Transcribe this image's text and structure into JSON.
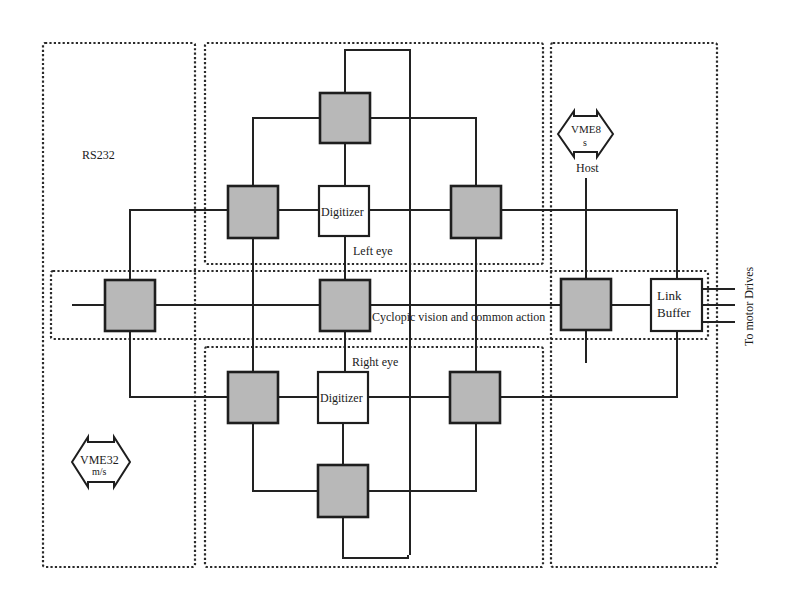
{
  "diagram": {
    "type": "hardware-architecture",
    "colors": {
      "node_fill": "#b8b8b8",
      "line": "#222222",
      "background": "#ffffff"
    },
    "regions": {
      "left_panel": {
        "label": "RS232"
      },
      "left_eye": {
        "label": "Left eye"
      },
      "right_eye": {
        "label": "Right eye"
      },
      "cyclopic": {
        "label": "Cyclopic vision and common action"
      },
      "right_panel": {}
    },
    "nodes": {
      "left_digitizer": {
        "label": "Digitizer"
      },
      "right_digitizer": {
        "label": "Digitizer"
      },
      "link_buffer": {
        "line1": "Link",
        "line2": "Buffer"
      }
    },
    "buses": {
      "vme8": {
        "line1": "VME8",
        "line2": "s",
        "caption": "Host"
      },
      "vme32": {
        "line1": "VME32",
        "line2": "m/s"
      }
    },
    "output_label": "To motor Drives"
  }
}
